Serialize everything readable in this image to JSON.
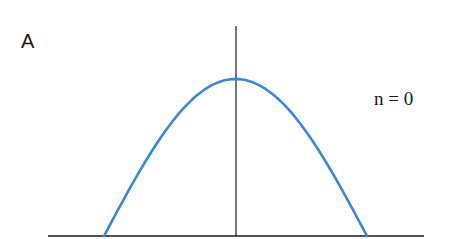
{
  "figure": {
    "panel_label": "A",
    "state_label": "n = 0",
    "colors": {
      "curve": "#3b86d6",
      "axes": "#1a1a1a",
      "background": "#ffffff"
    }
  },
  "chart_data": {
    "type": "line",
    "title": "",
    "panel": "A",
    "annotation": "n = 0",
    "xlabel": "",
    "ylabel": "",
    "grid": false,
    "legend": null,
    "series": [
      {
        "name": "n = 0",
        "shape": "half-cosine arch",
        "x": [
          -1.0,
          -0.75,
          -0.5,
          -0.25,
          0.0,
          0.25,
          0.5,
          0.75,
          1.0
        ],
        "y": [
          0.0,
          0.38,
          0.71,
          0.92,
          1.0,
          0.92,
          0.71,
          0.38,
          0.0
        ]
      }
    ],
    "xlim": [
      -1.45,
      1.45
    ],
    "ylim": [
      0,
      1.3
    ]
  }
}
